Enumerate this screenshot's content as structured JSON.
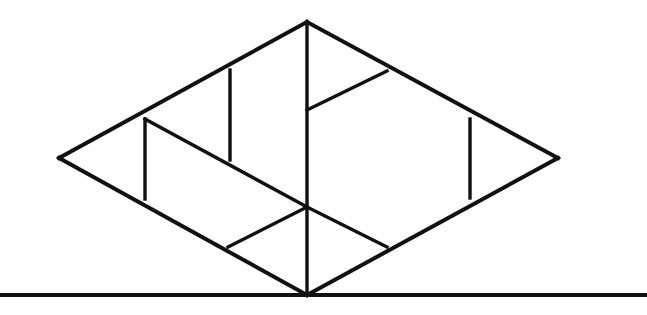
{
  "figure": {
    "background_color": "#ffffff",
    "ink_color": "#111111",
    "canvas": {
      "width": 647,
      "height": 315
    },
    "stroke_widths": {
      "outline": 4.0,
      "interior": 3.4,
      "ground": 4.0
    },
    "points": {
      "left": {
        "x": 59,
        "y": 158
      },
      "top": {
        "x": 307,
        "y": 22
      },
      "right": {
        "x": 558,
        "y": 158
      },
      "bottom": {
        "x": 307,
        "y": 295
      },
      "upper_left_mid": {
        "x": 145,
        "y": 119
      },
      "lower_left_mid": {
        "x": 145,
        "y": 199
      },
      "inner_vert2_top": {
        "x": 230,
        "y": 70
      },
      "inner_vert2_bottom": {
        "x": 230,
        "y": 160
      },
      "center_upper_node": {
        "x": 307,
        "y": 110
      },
      "upper_right_node": {
        "x": 387,
        "y": 71
      },
      "center_node": {
        "x": 307,
        "y": 207
      },
      "lower_left_node": {
        "x": 228,
        "y": 247
      },
      "lower_right_node": {
        "x": 387,
        "y": 247
      },
      "right_vert_top": {
        "x": 470,
        "y": 119
      },
      "right_vert_bottom": {
        "x": 470,
        "y": 198
      },
      "ground_left": {
        "x": 0,
        "y": 295
      },
      "ground_right": {
        "x": 647,
        "y": 295
      }
    },
    "segments": [
      {
        "name": "rhombus-edge-upper-left",
        "kind": "outline",
        "x1": 59,
        "y1": 158,
        "x2": 307,
        "y2": 22
      },
      {
        "name": "rhombus-edge-upper-right",
        "kind": "outline",
        "x1": 307,
        "y1": 22,
        "x2": 558,
        "y2": 158
      },
      {
        "name": "rhombus-edge-lower-right",
        "kind": "outline",
        "x1": 558,
        "y1": 158,
        "x2": 307,
        "y2": 295
      },
      {
        "name": "rhombus-edge-lower-left",
        "kind": "outline",
        "x1": 307,
        "y1": 295,
        "x2": 59,
        "y2": 158
      },
      {
        "name": "central-vertical-axis",
        "kind": "interior",
        "x1": 307,
        "y1": 22,
        "x2": 307,
        "y2": 295
      },
      {
        "name": "left-inner-vertical",
        "kind": "interior",
        "x1": 145,
        "y1": 119,
        "x2": 145,
        "y2": 199
      },
      {
        "name": "second-inner-vertical",
        "kind": "interior",
        "x1": 230,
        "y1": 70,
        "x2": 230,
        "y2": 160
      },
      {
        "name": "right-inner-vertical",
        "kind": "interior",
        "x1": 470,
        "y1": 119,
        "x2": 470,
        "y2": 198
      },
      {
        "name": "long-diagonal-upper-left-to-center",
        "kind": "interior",
        "x1": 145,
        "y1": 119,
        "x2": 307,
        "y2": 207
      },
      {
        "name": "diagonal-center-to-upper-right",
        "kind": "interior",
        "x1": 307,
        "y1": 110,
        "x2": 387,
        "y2": 71
      },
      {
        "name": "diagonal-center-to-lower-left",
        "kind": "interior",
        "x1": 307,
        "y1": 207,
        "x2": 228,
        "y2": 247
      },
      {
        "name": "diagonal-center-to-lower-right",
        "kind": "interior",
        "x1": 307,
        "y1": 207,
        "x2": 387,
        "y2": 247
      },
      {
        "name": "ground-line",
        "kind": "ground",
        "x1": 0,
        "y1": 295,
        "x2": 647,
        "y2": 295
      }
    ]
  }
}
